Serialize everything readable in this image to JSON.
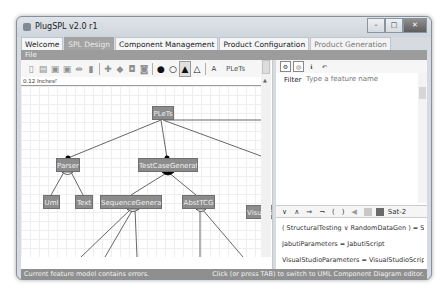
{
  "window": {
    "title": "PlugSPL v2.0 r1",
    "controls": {
      "minimize": "–",
      "maximize": "□",
      "close": "✕"
    }
  },
  "tabs": [
    {
      "label": "Welcome",
      "state": "normal"
    },
    {
      "label": "SPL Design",
      "state": "active"
    },
    {
      "label": "Component Management",
      "state": "normal"
    },
    {
      "label": "Product Configuration",
      "state": "normal"
    },
    {
      "label": "Product Generation",
      "state": "faded"
    }
  ],
  "menu": {
    "file": "File"
  },
  "toolbar": {
    "icons": [
      "new-file",
      "open",
      "save",
      "save-as",
      "link",
      "trash",
      "add",
      "erase",
      "lock",
      "unlock",
      "filled-circle",
      "empty-circle",
      "filled-triangle",
      "empty-triangle",
      "text"
    ],
    "text_tool": "A",
    "root_name": "PLeTs"
  },
  "editor": {
    "zoom_label": "0.12 Inches²",
    "nodes": [
      {
        "id": "root",
        "label": "PLeTs"
      },
      {
        "id": "parser",
        "label": "Parser"
      },
      {
        "id": "tcg",
        "label": "TestCaseGenerator"
      },
      {
        "id": "uml",
        "label": "Uml"
      },
      {
        "id": "text",
        "label": "Text"
      },
      {
        "id": "seqgen",
        "label": "SequenceGenerator"
      },
      {
        "id": "abstcg",
        "label": "AbstTCG"
      },
      {
        "id": "vs",
        "label": "VisualStudio"
      }
    ]
  },
  "right_panel": {
    "tool_icons": [
      "gear",
      "target",
      "info",
      "link"
    ],
    "filter_label": "Filter",
    "filter_placeholder": "Type a feature name",
    "constraint_tools": {
      "or": "∨",
      "and": "∧",
      "implies": "⇒",
      "not": "¬",
      "lparen": "(",
      "rparen": ")",
      "sat": "Sat-2"
    },
    "constraints": [
      "( StructuralTesting  ∨  RandomDataGen )  =  StructuralTesting",
      "JabutiParameters  =  JabutiScript",
      "VisualStudioParameters  =  VisualStudioScript",
      "LoadRunnerParameters  =  LoadRunnerScript"
    ]
  },
  "status": {
    "left": "Current feature model contains errors.",
    "right": "Click (or press TAB) to switch to UML Component Diagram editor."
  }
}
